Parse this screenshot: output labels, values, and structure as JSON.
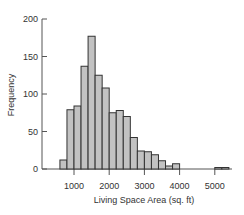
{
  "chart_data": {
    "type": "bar",
    "subtype": "histogram",
    "title": "",
    "xlabel": "Living Space Area (sq. ft)",
    "ylabel": "Frequency",
    "bin_width": 200,
    "bins": [
      {
        "start": 600,
        "end": 800,
        "count": 12
      },
      {
        "start": 800,
        "end": 1000,
        "count": 79
      },
      {
        "start": 1000,
        "end": 1200,
        "count": 84
      },
      {
        "start": 1200,
        "end": 1400,
        "count": 137
      },
      {
        "start": 1400,
        "end": 1600,
        "count": 177
      },
      {
        "start": 1600,
        "end": 1800,
        "count": 125
      },
      {
        "start": 1800,
        "end": 2000,
        "count": 108
      },
      {
        "start": 2000,
        "end": 2200,
        "count": 75
      },
      {
        "start": 2200,
        "end": 2400,
        "count": 78
      },
      {
        "start": 2400,
        "end": 2600,
        "count": 70
      },
      {
        "start": 2600,
        "end": 2800,
        "count": 42
      },
      {
        "start": 2800,
        "end": 3000,
        "count": 24
      },
      {
        "start": 3000,
        "end": 3200,
        "count": 23
      },
      {
        "start": 3200,
        "end": 3400,
        "count": 19
      },
      {
        "start": 3400,
        "end": 3600,
        "count": 11
      },
      {
        "start": 3600,
        "end": 3800,
        "count": 4
      },
      {
        "start": 3800,
        "end": 4000,
        "count": 7
      },
      {
        "start": 5000,
        "end": 5200,
        "count": 2
      },
      {
        "start": 5200,
        "end": 5400,
        "count": 2
      }
    ],
    "x_ticks": [
      1000,
      2000,
      3000,
      4000,
      5000
    ],
    "x_tick_labels": [
      "1000",
      "2000",
      "3000",
      "4000",
      "5000"
    ],
    "y_ticks": [
      0,
      50,
      100,
      150,
      200
    ],
    "y_tick_labels": [
      "0",
      "50",
      "100",
      "150",
      "200"
    ],
    "xlim": [
      400,
      5450
    ],
    "ylim": [
      0,
      200
    ],
    "grid": false,
    "legend": null,
    "colors": {
      "bar_fill": "#c2c2c2",
      "bar_stroke": "#333333",
      "axis": "#555555",
      "text": "#333333"
    }
  }
}
